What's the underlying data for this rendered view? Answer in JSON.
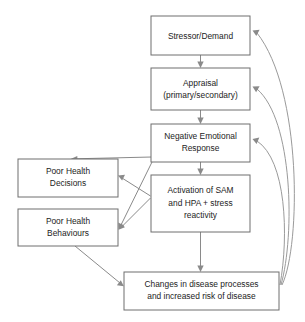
{
  "diagram": {
    "type": "flowchart",
    "background_color": "#ffffff",
    "box_stroke_color": "#6e6e6e",
    "box_fill_color": "#ffffff",
    "arrow_color": "#8a8a8a",
    "text_color": "#1c1c1c",
    "nodes": [
      {
        "id": "stressor",
        "lines": [
          "Stressor/Demand"
        ],
        "line1": "Stressor/Demand",
        "line2": "",
        "line3": "",
        "x": 151,
        "y": 16,
        "w": 99,
        "h": 39
      },
      {
        "id": "appraisal",
        "lines": [
          "Appraisal",
          "(primary/secondary)"
        ],
        "line1": "Appraisal",
        "line2": "(primary/secondary)",
        "line3": "",
        "x": 151,
        "y": 68,
        "w": 99,
        "h": 42
      },
      {
        "id": "negative-emotional-response",
        "lines": [
          "Negative Emotional",
          "Response"
        ],
        "line1": "Negative Emotional",
        "line2": "Response",
        "line3": "",
        "x": 151,
        "y": 124,
        "w": 99,
        "h": 38
      },
      {
        "id": "activation-sam-hpa",
        "lines": [
          "Activation of SAM",
          "and HPA + stress",
          "reactivity"
        ],
        "line1": "Activation of SAM",
        "line2": "and HPA + stress",
        "line3": "reactivity",
        "x": 151,
        "y": 175,
        "w": 99,
        "h": 57
      },
      {
        "id": "poor-health-decisions",
        "lines": [
          "Poor Health",
          "Decisions"
        ],
        "line1": "Poor Health",
        "line2": "Decisions",
        "line3": "",
        "x": 18,
        "y": 159,
        "w": 100,
        "h": 38
      },
      {
        "id": "poor-health-behaviours",
        "lines": [
          "Poor Health",
          "Behaviours"
        ],
        "line1": "Poor Health",
        "line2": "Behaviours",
        "line3": "",
        "x": 18,
        "y": 209,
        "w": 100,
        "h": 37
      },
      {
        "id": "changes-in-disease",
        "lines": [
          "Changes in disease processes",
          "and increased risk of disease"
        ],
        "line1": "Changes in disease processes",
        "line2": "and increased risk of disease",
        "line3": "",
        "x": 124,
        "y": 272,
        "w": 155,
        "h": 38
      }
    ],
    "edges": [
      {
        "id": "stressor-to-appraisal",
        "from": "stressor",
        "to": "appraisal",
        "kind": "straight"
      },
      {
        "id": "appraisal-to-negative",
        "from": "appraisal",
        "to": "negative-emotional-response",
        "kind": "straight"
      },
      {
        "id": "negative-to-activation",
        "from": "negative-emotional-response",
        "to": "activation-sam-hpa",
        "kind": "straight"
      },
      {
        "id": "activation-to-changes",
        "from": "activation-sam-hpa",
        "to": "changes-in-disease",
        "kind": "straight"
      },
      {
        "id": "negative-to-decisions",
        "from": "negative-emotional-response",
        "to": "poor-health-decisions",
        "kind": "diagonal"
      },
      {
        "id": "negative-to-behaviours",
        "from": "negative-emotional-response",
        "to": "poor-health-behaviours",
        "kind": "diagonal"
      },
      {
        "id": "activation-to-decisions",
        "from": "activation-sam-hpa",
        "to": "poor-health-decisions",
        "kind": "diagonal"
      },
      {
        "id": "activation-to-behaviours",
        "from": "activation-sam-hpa",
        "to": "poor-health-behaviours",
        "kind": "diagonal"
      },
      {
        "id": "behaviours-to-changes",
        "from": "poor-health-behaviours",
        "to": "changes-in-disease",
        "kind": "diagonal"
      },
      {
        "id": "changes-to-stressor",
        "from": "changes-in-disease",
        "to": "stressor",
        "kind": "feedback-curve"
      },
      {
        "id": "changes-to-appraisal",
        "from": "changes-in-disease",
        "to": "appraisal",
        "kind": "feedback-curve"
      },
      {
        "id": "changes-to-negative",
        "from": "changes-in-disease",
        "to": "negative-emotional-response",
        "kind": "feedback-curve"
      }
    ]
  }
}
